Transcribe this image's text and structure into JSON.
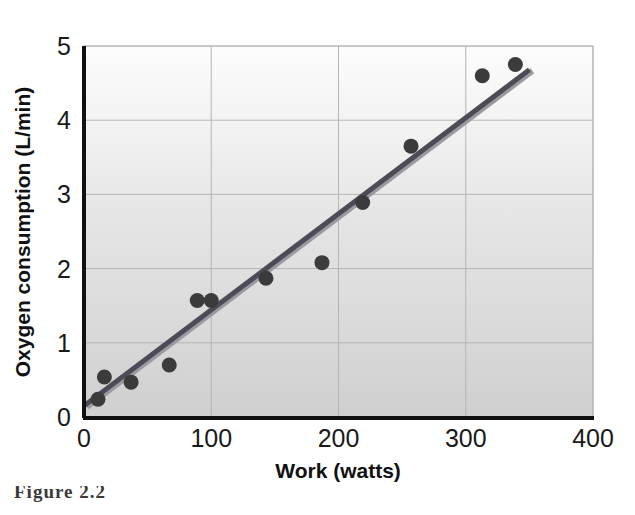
{
  "figure": {
    "caption_prefix": "Figure",
    "caption_number": "2.2",
    "caption_rest": ""
  },
  "axes": {
    "x_title": "Work (watts)",
    "y_title": "Oxygen consumption (L/min)",
    "x_ticks": [
      "0",
      "100",
      "200",
      "300",
      "400"
    ],
    "y_ticks": [
      "0",
      "1",
      "2",
      "3",
      "4",
      "5"
    ]
  },
  "colors": {
    "marker": "#3b3b3b",
    "trendline": "#4a4a56",
    "trendline_shadow": "#8d8d93",
    "grid": "#b8b8b8",
    "axis": "#111111",
    "plot_bg_top": "#fbfbfb",
    "plot_bg_bottom": "#d2d2d2"
  },
  "chart_data": {
    "type": "scatter",
    "title": "",
    "xlabel": "Work (watts)",
    "ylabel": "Oxygen consumption (L/min)",
    "xlim": [
      0,
      400
    ],
    "ylim": [
      0,
      5
    ],
    "xticks": [
      0,
      100,
      200,
      300,
      400
    ],
    "yticks": [
      0,
      1,
      2,
      3,
      4,
      5
    ],
    "grid": true,
    "legend": "none",
    "series": [
      {
        "name": "Oxygen consumption",
        "marker": "circle",
        "points": [
          {
            "x": 11,
            "y": 0.24
          },
          {
            "x": 16,
            "y": 0.54
          },
          {
            "x": 37,
            "y": 0.47
          },
          {
            "x": 67,
            "y": 0.7
          },
          {
            "x": 89,
            "y": 1.57
          },
          {
            "x": 100,
            "y": 1.57
          },
          {
            "x": 143,
            "y": 1.87
          },
          {
            "x": 187,
            "y": 2.08
          },
          {
            "x": 219,
            "y": 2.89
          },
          {
            "x": 257,
            "y": 3.65
          },
          {
            "x": 313,
            "y": 4.6
          },
          {
            "x": 339,
            "y": 4.75
          }
        ]
      }
    ],
    "trendline": {
      "type": "linear",
      "x_start": 0,
      "y_start": 0.15,
      "x_end": 350,
      "y_end": 4.68
    }
  }
}
